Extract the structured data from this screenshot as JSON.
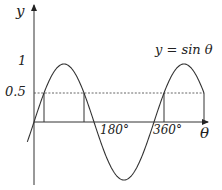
{
  "diagram": {
    "equation_label": "y = sin θ",
    "y_axis_label": "y",
    "x_axis_label": "θ",
    "y_ticks": [
      {
        "label": "1",
        "value": 1
      },
      {
        "label": "0.5",
        "value": 0.5
      }
    ],
    "x_ticks": [
      {
        "label": "180°",
        "value": 180
      },
      {
        "label": "360°",
        "value": 360
      }
    ],
    "reference_line": {
      "value": 0.5,
      "style": "dashed"
    },
    "intersection_angles": [
      30,
      150,
      390,
      510
    ],
    "curve_domain_deg": [
      -20,
      510
    ],
    "colors": {
      "curve": "#333333",
      "axes": "#333333",
      "dashed": "#555555"
    }
  }
}
